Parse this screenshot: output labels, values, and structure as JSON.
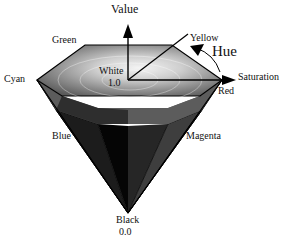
{
  "diagram": {
    "axes": {
      "value": "Value",
      "hue": "Hue",
      "saturation": "Saturation"
    },
    "vertices": {
      "green": "Green",
      "yellow": "Yellow",
      "cyan": "Cyan",
      "red": "Red",
      "blue": "Blue",
      "magenta": "Magenta"
    },
    "white": {
      "label": "White",
      "value": "1.0"
    },
    "black": {
      "label": "Black",
      "value": "0.0"
    },
    "colors": {
      "background": "#ffffff",
      "stroke": "#000000",
      "top_light": "#e6e6e6",
      "top_mid": "#b4b4b4",
      "side_dark": "#2a2a2a",
      "side_black": "#050505"
    }
  }
}
